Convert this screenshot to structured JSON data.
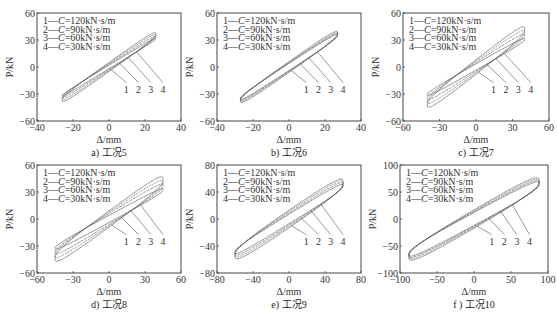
{
  "chart_data": [
    {
      "type": "line",
      "panel": "a",
      "caption": "a) 工况5",
      "xlabel": "Δ/mm",
      "ylabel": "P/kN",
      "xlim": [
        -40,
        40
      ],
      "ylim": [
        -60,
        60
      ],
      "xticks": [
        -40,
        -20,
        0,
        20,
        40
      ],
      "yticks": [
        -60,
        -30,
        0,
        30,
        60
      ],
      "grid": false,
      "legend_position": "upper left",
      "series": [
        {
          "name": "1—C=120kN·s/m",
          "amp": 26,
          "pmax": 42,
          "width": 10
        },
        {
          "name": "2—C=90kN·s/m",
          "amp": 26,
          "pmax": 40,
          "width": 8
        },
        {
          "name": "3—C=60kN·s/m",
          "amp": 26,
          "pmax": 38,
          "width": 6
        },
        {
          "name": "4—C=30kN·s/m",
          "amp": 26,
          "pmax": 36,
          "width": 4
        }
      ],
      "curve_labels": [
        "1",
        "2",
        "3",
        "4"
      ]
    },
    {
      "type": "line",
      "panel": "b",
      "caption": "b) 工况6",
      "xlabel": "Δ/mm",
      "ylabel": "P/kN",
      "xlim": [
        -40,
        40
      ],
      "ylim": [
        -60,
        60
      ],
      "xticks": [
        -40,
        -20,
        0,
        20,
        40
      ],
      "yticks": [
        -60,
        -30,
        0,
        30,
        60
      ],
      "grid": false,
      "legend_position": "upper left",
      "series": [
        {
          "name": "1—C=120kN·s/m",
          "amp": 27,
          "pmax": 43,
          "width": 12
        },
        {
          "name": "2—C=90kN·s/m",
          "amp": 27,
          "pmax": 42,
          "width": 10
        },
        {
          "name": "3—C=60kN·s/m",
          "amp": 27,
          "pmax": 41,
          "width": 9
        },
        {
          "name": "4—C=30kN·s/m",
          "amp": 27,
          "pmax": 40,
          "width": 8
        }
      ],
      "curve_labels": [
        "1",
        "2",
        "3",
        "4"
      ]
    },
    {
      "type": "line",
      "panel": "c",
      "caption": "c) 工况7",
      "xlabel": "Δ/mm",
      "ylabel": "P/kN",
      "xlim": [
        -60,
        60
      ],
      "ylim": [
        -60,
        60
      ],
      "xticks": [
        -60,
        -30,
        0,
        30,
        60
      ],
      "yticks": [
        -60,
        -30,
        0,
        30,
        60
      ],
      "grid": false,
      "legend_position": "upper left",
      "series": [
        {
          "name": "1—C=120kN·s/m",
          "amp": 40,
          "pmax": 48,
          "width": 16
        },
        {
          "name": "2—C=90kN·s/m",
          "amp": 40,
          "pmax": 44,
          "width": 13
        },
        {
          "name": "3—C=60kN·s/m",
          "amp": 40,
          "pmax": 40,
          "width": 10
        },
        {
          "name": "4—C=30kN·s/m",
          "amp": 40,
          "pmax": 35,
          "width": 7
        }
      ],
      "curve_labels": [
        "1",
        "2",
        "3",
        "4"
      ]
    },
    {
      "type": "line",
      "panel": "d",
      "caption": "d) 工况8",
      "xlabel": "Δ/mm",
      "ylabel": "P/kN",
      "xlim": [
        -60,
        60
      ],
      "ylim": [
        -60,
        60
      ],
      "xticks": [
        -60,
        -30,
        0,
        30,
        60
      ],
      "yticks": [
        -60,
        -30,
        0,
        30,
        60
      ],
      "grid": false,
      "legend_position": "upper left",
      "series": [
        {
          "name": "1—C=120kN·s/m",
          "amp": 45,
          "pmax": 50,
          "width": 18
        },
        {
          "name": "2—C=90kN·s/m",
          "amp": 45,
          "pmax": 46,
          "width": 15
        },
        {
          "name": "3—C=60kN·s/m",
          "amp": 45,
          "pmax": 42,
          "width": 12
        },
        {
          "name": "4—C=30kN·s/m",
          "amp": 45,
          "pmax": 37,
          "width": 8
        }
      ],
      "curve_labels": [
        "1",
        "2",
        "3",
        "4"
      ]
    },
    {
      "type": "line",
      "panel": "e",
      "caption": "e) 工况9",
      "xlabel": "Δ/mm",
      "ylabel": "P/kN",
      "xlim": [
        -80,
        80
      ],
      "ylim": [
        -80,
        80
      ],
      "xticks": [
        -80,
        -40,
        0,
        40,
        80
      ],
      "yticks": [
        -80,
        -40,
        0,
        40,
        80
      ],
      "grid": false,
      "legend_position": "upper left",
      "series": [
        {
          "name": "1—C=120kN·s/m",
          "amp": 60,
          "pmax": 62,
          "width": 26
        },
        {
          "name": "2—C=90kN·s/m",
          "amp": 60,
          "pmax": 60,
          "width": 22
        },
        {
          "name": "3—C=60kN·s/m",
          "amp": 60,
          "pmax": 58,
          "width": 18
        },
        {
          "name": "4—C=30kN·s/m",
          "amp": 60,
          "pmax": 56,
          "width": 14
        }
      ],
      "curve_labels": [
        "1",
        "2",
        "3",
        "4"
      ]
    },
    {
      "type": "line",
      "panel": "f",
      "caption": "f ) 工况10",
      "xlabel": "Δ/mm",
      "ylabel": "P/kN",
      "xlim": [
        -100,
        100
      ],
      "ylim": [
        -100,
        100
      ],
      "xticks": [
        -100,
        -50,
        0,
        50,
        100
      ],
      "yticks": [
        -100,
        -50,
        0,
        50,
        100
      ],
      "grid": false,
      "legend_position": "upper left",
      "series": [
        {
          "name": "1—C=120kN·s/m",
          "amp": 88,
          "pmax": 80,
          "width": 34
        },
        {
          "name": "2—C=90kN·s/m",
          "amp": 88,
          "pmax": 78,
          "width": 30
        },
        {
          "name": "3—C=60kN·s/m",
          "amp": 88,
          "pmax": 76,
          "width": 27
        },
        {
          "name": "4—C=30kN·s/m",
          "amp": 88,
          "pmax": 74,
          "width": 24
        }
      ],
      "curve_labels": [
        "1",
        "2",
        "3",
        "4"
      ]
    }
  ],
  "colors": {
    "curve": "#555555",
    "axis": "#444444",
    "text": "#222222"
  }
}
